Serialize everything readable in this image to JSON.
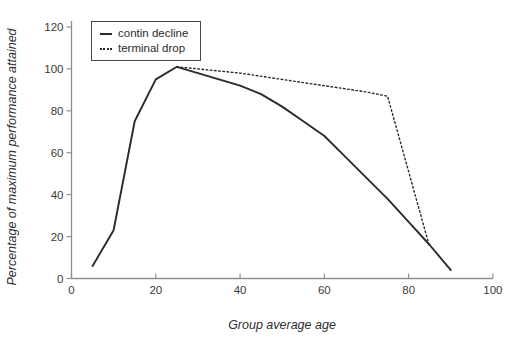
{
  "colors": {
    "line": "#2b2b2b",
    "axis": "#8f8f8f",
    "tick_text": "#3a3a3a",
    "legend_border": "#4a4a4a",
    "background": "#ffffff"
  },
  "legend": {
    "items": [
      {
        "label": "contin decline",
        "style": "solid"
      },
      {
        "label": "terminal drop",
        "style": "dotted"
      }
    ]
  },
  "chart_data": {
    "type": "line",
    "title": "",
    "xlabel": "Group average age",
    "ylabel": "Percentage of maximum performance attained",
    "xlim": [
      0,
      100
    ],
    "ylim": [
      0,
      120
    ],
    "x_ticks": [
      0,
      20,
      40,
      60,
      80,
      100
    ],
    "y_ticks": [
      0,
      20,
      40,
      60,
      80,
      100,
      120
    ],
    "grid": false,
    "legend_position": "top-left",
    "series": [
      {
        "name": "contin decline",
        "style": "solid",
        "x": [
          5,
          10,
          15,
          20,
          25,
          30,
          35,
          40,
          45,
          50,
          55,
          60,
          65,
          70,
          75,
          80,
          85,
          90
        ],
        "y": [
          6,
          23,
          75,
          95,
          101,
          98,
          95,
          92,
          88,
          82,
          75,
          68,
          58,
          48,
          38,
          27,
          16,
          4
        ]
      },
      {
        "name": "terminal drop",
        "style": "dotted",
        "x": [
          25,
          30,
          40,
          50,
          60,
          70,
          75,
          85
        ],
        "y": [
          101,
          100,
          98,
          95,
          92,
          89,
          87,
          15
        ]
      }
    ]
  }
}
